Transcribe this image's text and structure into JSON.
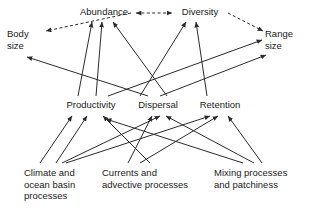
{
  "diagram": {
    "stroke_color": "#2b2b2b",
    "background_color": "#ffffff",
    "nodes": [
      {
        "id": "body_size",
        "label": "Body\nsize",
        "x": 7,
        "y": 28,
        "w": 40,
        "align": "left",
        "tier": "attribute"
      },
      {
        "id": "abundance",
        "label": "Abundance",
        "x": 76,
        "y": 6,
        "w": 56,
        "align": "center",
        "tier": "attribute"
      },
      {
        "id": "diversity",
        "label": "Diversity",
        "x": 176,
        "y": 6,
        "w": 48,
        "align": "center",
        "tier": "attribute"
      },
      {
        "id": "range_size",
        "label": "Range\nsize",
        "x": 265,
        "y": 28,
        "w": 42,
        "align": "left",
        "tier": "attribute"
      },
      {
        "id": "productivity",
        "label": "Productivity",
        "x": 62,
        "y": 99,
        "w": 58,
        "align": "center",
        "tier": "process"
      },
      {
        "id": "dispersal",
        "label": "Dispersal",
        "x": 133,
        "y": 99,
        "w": 50,
        "align": "center",
        "tier": "process"
      },
      {
        "id": "retention",
        "label": "Retention",
        "x": 195,
        "y": 99,
        "w": 50,
        "align": "center",
        "tier": "process"
      },
      {
        "id": "climate",
        "label": "Climate and\nocean basin\nprocesses",
        "x": 24,
        "y": 167,
        "w": 70,
        "align": "left",
        "tier": "driver"
      },
      {
        "id": "currents",
        "label": "Currents and\nadvective processes",
        "x": 102,
        "y": 167,
        "w": 96,
        "align": "left",
        "tier": "driver"
      },
      {
        "id": "mixing",
        "label": "Mixing processes\nand patchiness",
        "x": 214,
        "y": 167,
        "w": 90,
        "align": "left",
        "tier": "driver"
      }
    ],
    "edges": [
      {
        "from": "diversity",
        "to": "body_size",
        "style": "dashed",
        "x1": 131,
        "y1": 13,
        "x2": 46,
        "y2": 31
      },
      {
        "from": "abundance",
        "to": "diversity",
        "style": "dashed",
        "x1": 136,
        "y1": 13,
        "x2": 172,
        "y2": 13,
        "arrows": "both"
      },
      {
        "from": "diversity",
        "to": "range_size",
        "style": "dashed",
        "x1": 228,
        "y1": 13,
        "x2": 263,
        "y2": 31
      },
      {
        "from": "productivity",
        "to": "abundance",
        "style": "solid",
        "x1": 78,
        "y1": 96,
        "x2": 92,
        "y2": 22
      },
      {
        "from": "productivity",
        "to": "abundance",
        "style": "solid",
        "x1": 96,
        "y1": 96,
        "x2": 102,
        "y2": 22
      },
      {
        "from": "dispersal",
        "to": "abundance",
        "style": "solid",
        "x1": 167,
        "y1": 96,
        "x2": 113,
        "y2": 22
      },
      {
        "from": "dispersal",
        "to": "diversity",
        "style": "solid",
        "x1": 140,
        "y1": 96,
        "x2": 186,
        "y2": 22
      },
      {
        "from": "retention",
        "to": "diversity",
        "style": "solid",
        "x1": 207,
        "y1": 96,
        "x2": 196,
        "y2": 22
      },
      {
        "from": "productivity",
        "to": "range_size",
        "style": "solid",
        "x1": 108,
        "y1": 96,
        "x2": 262,
        "y2": 40
      },
      {
        "from": "dispersal",
        "to": "range_size",
        "style": "solid",
        "x1": 160,
        "y1": 96,
        "x2": 266,
        "y2": 55
      },
      {
        "from": "dispersal",
        "to": "body_size",
        "style": "solid",
        "x1": 148,
        "y1": 96,
        "x2": 27,
        "y2": 57
      },
      {
        "from": "climate",
        "to": "productivity",
        "style": "solid",
        "x1": 40,
        "y1": 163,
        "x2": 72,
        "y2": 116
      },
      {
        "from": "climate",
        "to": "productivity",
        "style": "solid",
        "x1": 56,
        "y1": 163,
        "x2": 87,
        "y2": 116
      },
      {
        "from": "climate",
        "to": "dispersal",
        "style": "solid",
        "x1": 62,
        "y1": 163,
        "x2": 160,
        "y2": 116
      },
      {
        "from": "climate",
        "to": "retention",
        "style": "solid",
        "x1": 66,
        "y1": 163,
        "x2": 210,
        "y2": 116
      },
      {
        "from": "currents",
        "to": "productivity",
        "style": "solid",
        "x1": 150,
        "y1": 163,
        "x2": 103,
        "y2": 116
      },
      {
        "from": "currents",
        "to": "dispersal",
        "style": "solid",
        "x1": 128,
        "y1": 163,
        "x2": 152,
        "y2": 116
      },
      {
        "from": "currents",
        "to": "retention",
        "style": "solid",
        "x1": 140,
        "y1": 163,
        "x2": 218,
        "y2": 116
      },
      {
        "from": "mixing",
        "to": "productivity",
        "style": "solid",
        "x1": 243,
        "y1": 163,
        "x2": 106,
        "y2": 119
      },
      {
        "from": "mixing",
        "to": "dispersal",
        "style": "solid",
        "x1": 254,
        "y1": 163,
        "x2": 166,
        "y2": 116
      },
      {
        "from": "mixing",
        "to": "retention",
        "style": "solid",
        "x1": 262,
        "y1": 163,
        "x2": 228,
        "y2": 116
      }
    ]
  }
}
